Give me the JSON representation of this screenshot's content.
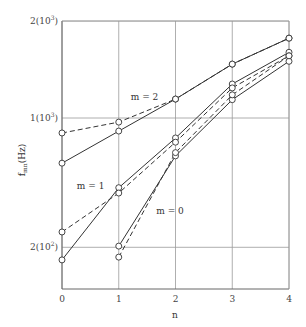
{
  "chart_data": {
    "type": "line",
    "title": "",
    "xlabel": "n",
    "ylabel": "f_mn(Hz)",
    "ylabel_main": "f",
    "ylabel_sub": "mn",
    "ylabel_unit": "(Hz)",
    "yscale": "log",
    "xlim": [
      0,
      4
    ],
    "ylim": [
      140,
      2000
    ],
    "grid": true,
    "x_ticks": [
      "0",
      "1",
      "2",
      "3",
      "4"
    ],
    "y_ticks": [
      {
        "value": 2000,
        "label": "2(10",
        "sup": "3",
        "close": ")"
      },
      {
        "value": 1000,
        "label": "1(10",
        "sup": "3",
        "close": ")"
      },
      {
        "value": 200,
        "label": "2(10",
        "sup": "2",
        "close": ")"
      }
    ],
    "annotations": [
      {
        "text": "m = 2",
        "x": 1.0,
        "y_px": 100
      },
      {
        "text": "m = 1",
        "x": 0.05,
        "y_px": 189
      },
      {
        "text": "m = 0",
        "x": 1.45,
        "y_px": 214
      }
    ],
    "series": [
      {
        "name": "m = 2 (solid)",
        "style": "solid",
        "x": [
          0,
          1,
          2,
          3,
          4
        ],
        "values": [
          570,
          850,
          1145,
          1470,
          1770
        ]
      },
      {
        "name": "m = 2 (dashed)",
        "style": "dashed",
        "x": [
          0,
          1,
          2,
          3,
          4
        ],
        "values": [
          830,
          950,
          1145,
          1470,
          1770
        ]
      },
      {
        "name": "m = 1 (solid)",
        "style": "solid",
        "x": [
          0,
          1,
          2,
          3,
          4
        ],
        "values": [
          171,
          420,
          780,
          1275,
          1600
        ]
      },
      {
        "name": "m = 1 (dashed)",
        "style": "dashed",
        "x": [
          0,
          1,
          2,
          3,
          4
        ],
        "values": [
          242,
          393,
          740,
          1240,
          1560
        ]
      },
      {
        "name": "m = 0 (solid)",
        "style": "solid",
        "x": [
          1,
          2,
          3,
          4
        ],
        "values": [
          203,
          624,
          1140,
          1500
        ]
      },
      {
        "name": "m = 0 (dashed)",
        "style": "dashed",
        "x": [
          1,
          2,
          3,
          4
        ],
        "values": [
          177,
          650,
          1180,
          1560
        ]
      }
    ]
  },
  "colors": {
    "line": "#333333",
    "grid": "#9a9a9a",
    "axis": "#666666",
    "marker_fill": "#ffffff"
  }
}
